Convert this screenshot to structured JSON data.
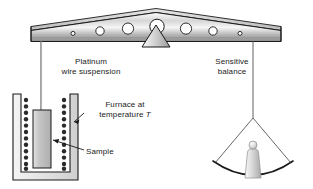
{
  "diagram": {
    "labels": {
      "platinum_wire": "Platinum\nwire suspension",
      "sensitive_balance": "Sensitive\nbalance",
      "furnace_line1": "Furnace at",
      "furnace_line2": "temperature ",
      "furnace_symbol": "T",
      "sample": "Sample"
    },
    "beam": {
      "name": "balance-beam",
      "hole_count": 7,
      "hole_radii": [
        2.0,
        4.2,
        5.6,
        7.2,
        5.6,
        4.2,
        2.0
      ],
      "hole_centers_x": [
        73,
        100,
        128,
        157,
        186,
        213,
        240
      ],
      "left_end_x": 31,
      "right_end_x": 281,
      "apex_x": 156
    },
    "fulcrum": {
      "name": "fulcrum-triangle",
      "apex_x": 156,
      "half_width": 14,
      "height": 16
    },
    "furnace": {
      "name": "furnace-enclosure",
      "x": 13,
      "y": 94,
      "width": 65,
      "height": 86,
      "coil_dot_count_left": 12,
      "coil_dot_count_right": 12,
      "coil_dot_radius": 2.2
    },
    "sample": {
      "name": "sample-block",
      "x": 33,
      "y": 110,
      "width": 18,
      "height": 58
    },
    "pan": {
      "name": "balance-pan",
      "center_x": 253,
      "suspension_top_y": 118,
      "arc_y": 170
    },
    "weight": {
      "name": "calibration-weight",
      "center_x": 253,
      "knob_radius": 4
    },
    "colors": {
      "outline": "#1a1a1a",
      "metal_light": "#f2f2f2",
      "metal_mid": "#c9c9c9",
      "metal_dark": "#9a9a9a",
      "sample_fill": "#bdbdbd",
      "coil_dot": "#2b2b2b",
      "text": "#1a1a1a",
      "background": "#ffffff"
    }
  }
}
